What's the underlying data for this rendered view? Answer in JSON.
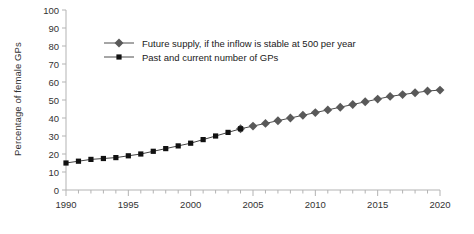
{
  "chart_data": {
    "type": "line",
    "title": "",
    "xlabel": "",
    "ylabel": "Percentage of female GPs",
    "xlim": [
      1990,
      2020
    ],
    "ylim": [
      0,
      100
    ],
    "ytick_labels": [
      "0",
      "10",
      "20",
      "30",
      "40",
      "50",
      "60",
      "70",
      "80",
      "90",
      "100"
    ],
    "yticks": [
      0,
      10,
      20,
      30,
      40,
      50,
      60,
      70,
      80,
      90,
      100
    ],
    "xtick_labels": [
      "1990",
      "1995",
      "2000",
      "2005",
      "2010",
      "2015",
      "2020"
    ],
    "xticks": [
      1990,
      1995,
      2000,
      2005,
      2010,
      2015,
      2020
    ],
    "x_minor_tick_step": 1,
    "grid": false,
    "legend_position": "top-left-inside",
    "series": [
      {
        "name": "Future supply, if the inflow is stable at 500 per year",
        "marker": "diamond",
        "color": "#595959",
        "line_color": "#4d4d4d",
        "x": [
          2004,
          2005,
          2006,
          2007,
          2008,
          2009,
          2010,
          2011,
          2012,
          2013,
          2014,
          2015,
          2016,
          2017,
          2018,
          2019,
          2020
        ],
        "values": [
          34,
          35.5,
          37,
          38.5,
          40,
          41.5,
          43,
          44.5,
          46,
          47.5,
          49,
          50.5,
          52,
          53,
          54,
          55,
          55.5
        ]
      },
      {
        "name": "Past and current number of GPs",
        "marker": "square",
        "color": "#111111",
        "line_color": "#444444",
        "x": [
          1990,
          1991,
          1992,
          1993,
          1994,
          1995,
          1996,
          1997,
          1998,
          1999,
          2000,
          2001,
          2002,
          2003,
          2004
        ],
        "values": [
          15,
          16,
          17,
          17.5,
          18,
          19,
          20,
          21.5,
          23,
          24.5,
          26,
          28,
          30,
          32,
          34
        ]
      }
    ],
    "legend_entries": [
      {
        "label": "Future supply, if the inflow is stable at 500 per year",
        "marker": "diamond",
        "color": "#595959"
      },
      {
        "label": "Past and current number of GPs",
        "marker": "square",
        "color": "#111111"
      }
    ],
    "axis_color": "#b3b3b3"
  }
}
